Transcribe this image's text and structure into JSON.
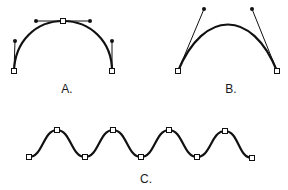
{
  "figures": [
    {
      "id": "A",
      "label": "A.",
      "label_pos": [
        67,
        82
      ],
      "curve": "M14,71 C15,41 36,21 63,21 C90,21 112,41 112,71",
      "anchors": [
        [
          14,
          71
        ],
        [
          63,
          21
        ],
        [
          112,
          71
        ]
      ],
      "handles": [
        {
          "from": [
            14,
            71
          ],
          "to": [
            15,
            41
          ]
        },
        {
          "from": [
            63,
            21
          ],
          "to": [
            36,
            21
          ]
        },
        {
          "from": [
            63,
            21
          ],
          "to": [
            90,
            21
          ]
        },
        {
          "from": [
            112,
            71
          ],
          "to": [
            112,
            41
          ]
        }
      ]
    },
    {
      "id": "B",
      "label": "B.",
      "label_pos": [
        231,
        82
      ],
      "curve": "M178,71 C204,9 252,9 277,71",
      "anchors": [
        [
          178,
          71
        ],
        [
          277,
          71
        ]
      ],
      "handles": [
        {
          "from": [
            178,
            71
          ],
          "to": [
            204,
            9
          ]
        },
        {
          "from": [
            277,
            71
          ],
          "to": [
            252,
            9
          ]
        }
      ]
    },
    {
      "id": "C",
      "label": "C.",
      "label_pos": [
        146,
        172
      ],
      "curve": "M29,157 C43,157 43,130 57,130 C71,130 71,157 85,157 C99,157 99,130 113,130 C127,130 127,157 141,157 C155,157 155,130 169,130 C183,130 183,157 197,157 C211,157 211,131 225,131 C239,131 238,158 252,158",
      "anchors": [
        [
          29,
          157
        ],
        [
          57,
          130
        ],
        [
          85,
          157
        ],
        [
          113,
          130
        ],
        [
          141,
          157
        ],
        [
          169,
          130
        ],
        [
          197,
          157
        ],
        [
          225,
          131
        ],
        [
          252,
          158
        ]
      ],
      "handles": []
    }
  ],
  "colors": {
    "stroke": "#111111",
    "background": "#ffffff"
  }
}
